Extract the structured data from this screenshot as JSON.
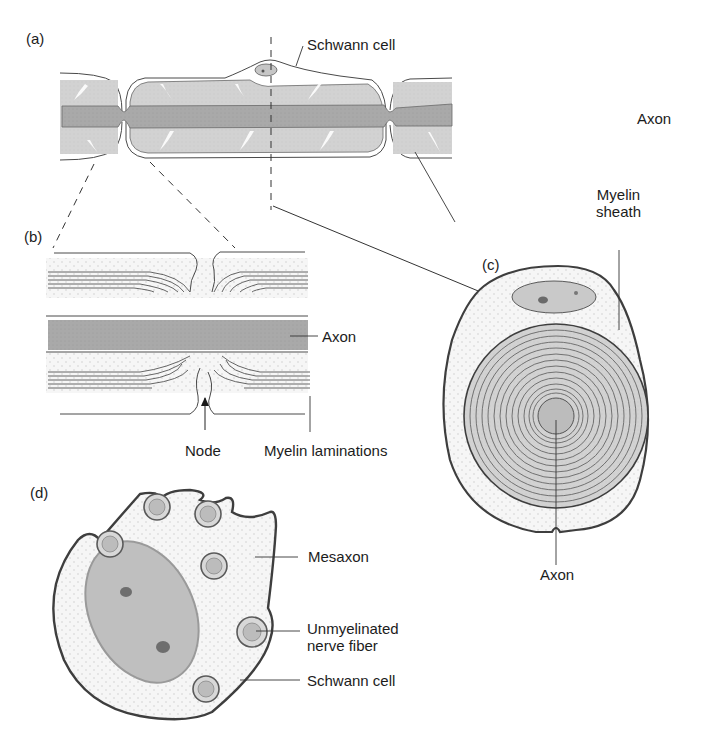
{
  "figure": {
    "panels": [
      {
        "id": "a",
        "label": "(a)"
      },
      {
        "id": "b",
        "label": "(b)"
      },
      {
        "id": "c",
        "label": "(c)"
      },
      {
        "id": "d",
        "label": "(d)"
      }
    ],
    "labels": {
      "a_schwann_cell": "Schwann cell",
      "a_axon": "Axon",
      "a_myelin_sheath_1": "Myelin",
      "a_myelin_sheath_2": "sheath",
      "b_axon": "Axon",
      "b_node": "Node",
      "b_myelin_laminations": "Myelin laminations",
      "c_axon": "Axon",
      "d_mesaxon": "Mesaxon",
      "d_unmyelinated_1": "Unmyelinated",
      "d_unmyelinated_2": "nerve fiber",
      "d_schwann_cell": "Schwann cell"
    },
    "colors": {
      "axon": "#a8a8a8",
      "myelin": "#cfcfcf",
      "cytoplasm": "#f4f4f4",
      "outline": "#4a4a4a",
      "nucleus": "#bdbdbd",
      "nucleolus": "#6e6e6e"
    }
  }
}
